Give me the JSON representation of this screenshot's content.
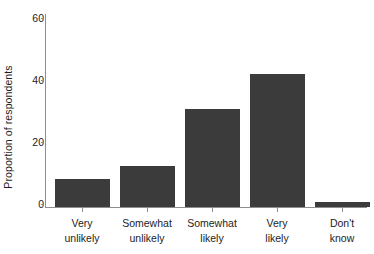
{
  "chart_data": {
    "type": "bar",
    "title": "",
    "subtitle": "",
    "xlabel": "",
    "ylabel": "Proportion of respondents",
    "categories": [
      "Very unlikely",
      "Somewhat unlikely",
      "Somewhat likely",
      "Very likely",
      "Don't know"
    ],
    "category_lines": [
      [
        "Very",
        "unlikely"
      ],
      [
        "Somewhat",
        "unlikely"
      ],
      [
        "Somewhat",
        "likely"
      ],
      [
        "Very",
        "likely"
      ],
      [
        "Don't",
        "know"
      ]
    ],
    "values": [
      9,
      13.5,
      32,
      43.5,
      1.5
    ],
    "ylim": [
      0,
      63
    ],
    "yticks": [
      0,
      20,
      40,
      60
    ],
    "ytick_labels": [
      "0",
      "20",
      "40",
      "60"
    ],
    "grid": false,
    "legend": "none",
    "bar_color": "#3b3b3b",
    "axis_color": "#8d8d8d",
    "background_color": "#ffffff",
    "text_color": "#1d1d1d"
  }
}
